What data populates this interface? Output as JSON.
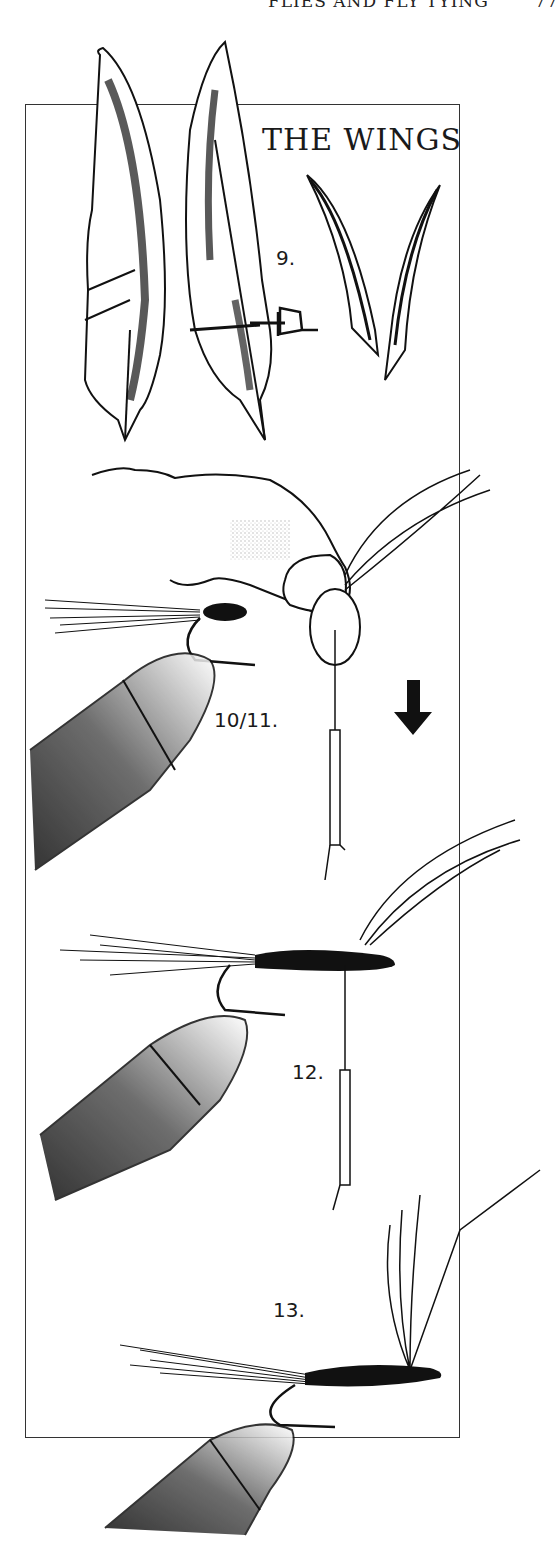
{
  "running_header": {
    "title": "FLIES AND FLY TYING",
    "page_number": "77"
  },
  "section_title": "THE WINGS",
  "steps": [
    {
      "label": "9.",
      "description": "feather-slips-cut-from-pair-of-quills"
    },
    {
      "label": "10/11.",
      "description": "hand-pinching-wing-slips-on-hook-thread-pulled-down"
    },
    {
      "label": "12.",
      "description": "wing-slips-tied-on-hook-body"
    },
    {
      "label": "13.",
      "description": "wings-upright-completed-fly"
    }
  ],
  "colors": {
    "ink": "#1a1a1a",
    "paper": "#ffffff",
    "frame": "#333333"
  }
}
